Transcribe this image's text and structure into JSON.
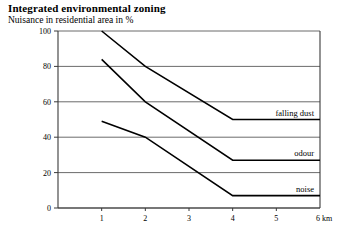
{
  "chart_data": {
    "type": "line",
    "title": "Integrated environmental zoning",
    "subtitle": "Nuisance in residential area in %",
    "xlabel": "6 km",
    "ylabel": "",
    "xlim": [
      0,
      6
    ],
    "ylim": [
      0,
      100
    ],
    "grid": true,
    "grid_axis": "y",
    "legend_position": "inline-right",
    "x_ticks": [
      "1",
      "2",
      "3",
      "4",
      "5",
      "6 km"
    ],
    "x_tick_values": [
      1,
      2,
      3,
      4,
      5,
      6
    ],
    "y_ticks": [
      "0",
      "20",
      "40",
      "60",
      "80",
      "100"
    ],
    "y_tick_values": [
      0,
      20,
      40,
      60,
      80,
      100
    ],
    "x": [
      1,
      2,
      4,
      6
    ],
    "series": [
      {
        "name": "falling dust",
        "label": "falling dust",
        "color": "#000000",
        "values": [
          100,
          80,
          50,
          50
        ]
      },
      {
        "name": "odour",
        "label": "odour",
        "color": "#000000",
        "values": [
          84,
          60,
          27,
          27
        ]
      },
      {
        "name": "noise",
        "label": "noise",
        "color": "#000000",
        "values": [
          49,
          40,
          7,
          7
        ]
      }
    ]
  },
  "axis": {
    "x_unit": "km",
    "y_unit": "%"
  }
}
